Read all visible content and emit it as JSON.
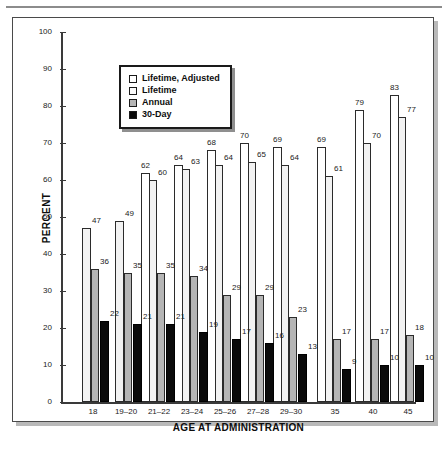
{
  "figure": {
    "y_axis_title": "PERCENT",
    "x_axis_title": "AGE AT ADMINISTRATION"
  },
  "legend": {
    "position": "top-left-inside",
    "items": [
      {
        "label": "Lifetime, Adjusted",
        "swatch": "white-open-square",
        "color": "#ffffff"
      },
      {
        "label": "Lifetime",
        "swatch": "white-open-square",
        "color": "#fafafa"
      },
      {
        "label": "Annual",
        "swatch": "gray-filled-square",
        "color": "#b5b5b5"
      },
      {
        "label": "30-Day",
        "swatch": "black-filled-square",
        "color": "#0a0a0a"
      }
    ]
  },
  "chart_data": {
    "type": "bar",
    "title": "",
    "xlabel": "AGE AT ADMINISTRATION",
    "ylabel": "PERCENT",
    "ylim": [
      0,
      100
    ],
    "yticks": [
      0,
      10,
      20,
      30,
      40,
      50,
      60,
      70,
      80,
      90,
      100
    ],
    "grid": false,
    "legend_position": "upper left",
    "categories": [
      "18",
      "19–20",
      "21–22",
      "23–24",
      "25–26",
      "27–28",
      "29–30",
      "35",
      "40",
      "45"
    ],
    "series": [
      {
        "name": "Lifetime, Adjusted",
        "color": "#ffffff",
        "values": [
          null,
          null,
          62,
          64,
          68,
          70,
          69,
          69,
          79,
          83
        ]
      },
      {
        "name": "Lifetime",
        "color": "#f2f2f2",
        "values": [
          47,
          49,
          60,
          63,
          64,
          65,
          64,
          61,
          70,
          77
        ]
      },
      {
        "name": "Annual",
        "color": "#b5b5b5",
        "values": [
          36,
          35,
          35,
          34,
          29,
          29,
          23,
          17,
          17,
          18
        ]
      },
      {
        "name": "30-Day",
        "color": "#0a0a0a",
        "values": [
          22,
          21,
          21,
          19,
          17,
          16,
          13,
          9,
          10,
          10
        ]
      }
    ]
  }
}
